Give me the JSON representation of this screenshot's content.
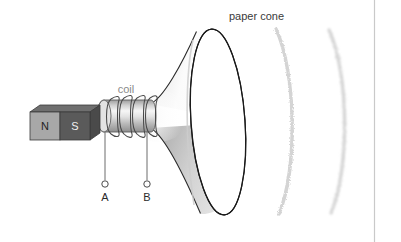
{
  "figure": {
    "background_color": "#ffffff",
    "width": 401,
    "height": 242
  },
  "labels": {
    "paper_cone": "paper cone",
    "coil": "coil",
    "terminal_a": "A",
    "terminal_b": "B",
    "pole_north": "N",
    "pole_south": "S"
  },
  "colors": {
    "outline": "#1a1a1a",
    "cone_shade_light": "#ffffff",
    "cone_shade_dark": "#9a9a9a",
    "magnet_north": "#a8a8a8",
    "magnet_south": "#5a5a5a",
    "magnet_top": "#6f6f6f",
    "coil_body_light": "#f2f2f2",
    "coil_body_dark": "#9d9d9d",
    "wire": "#6d6d6d",
    "sound_wave": "#d8d8d8",
    "label_cone": "#3a3a3a",
    "label_coil": "#8a8a8a",
    "border_line": "#c9c9c9"
  },
  "parts": {
    "magnet": {
      "name": "bar magnet",
      "north_label": "N",
      "south_label": "S"
    },
    "coil": {
      "name": "coil",
      "turns": 4
    },
    "cone": {
      "name": "paper cone"
    },
    "terminals": [
      {
        "id": "A",
        "label": "A"
      },
      {
        "id": "B",
        "label": "B"
      }
    ],
    "sound_waves": {
      "name": "sound waves",
      "count": 2
    }
  }
}
